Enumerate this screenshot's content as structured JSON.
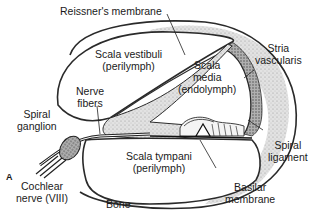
{
  "figure": {
    "panel_letter": "A",
    "colors": {
      "outline": "#2a2a2a",
      "stipple_fill": "#d9d9d9",
      "stria_fill": "#b8b8b8",
      "background": "#ffffff"
    }
  },
  "labels": {
    "reissners_membrane": "Reissner's membrane",
    "scala_vestibuli": [
      "Scala vestibuli",
      "(perilymph)"
    ],
    "scala_media": [
      "Scala",
      "media",
      "(endolymph)"
    ],
    "stria_vascularis": [
      "Stria",
      "vascularis"
    ],
    "nerve_fibers": [
      "Nerve",
      "fibers"
    ],
    "spiral_ganglion": [
      "Spiral",
      "ganglion"
    ],
    "scala_tympani": [
      "Scala tympani",
      "(perilymph)"
    ],
    "spiral_ligament": [
      "Spiral",
      "ligament"
    ],
    "cochlear_nerve": [
      "Cochlear",
      "nerve (VIII)"
    ],
    "bone": "Bone",
    "basilar_membrane": [
      "Basilar",
      "membrane"
    ]
  }
}
